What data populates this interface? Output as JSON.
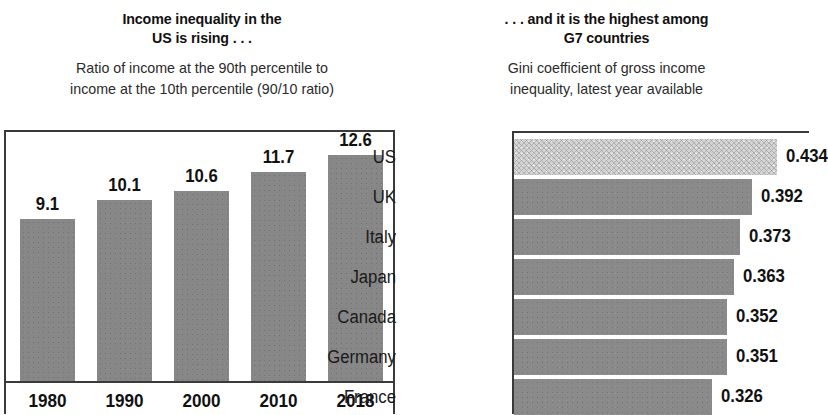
{
  "left_panel": {
    "title": "Income inequality in the\nUS is rising . . .",
    "subtitle": "Ratio of income at the 90th percentile to\nincome at the 10th percentile (90/10 ratio)"
  },
  "right_panel": {
    "title": ". . . and it is the highest among\nG7 countries",
    "subtitle": "Gini coefficient of gross income\ninequality, latest year available"
  },
  "colors": {
    "bar_gray": "#8a8a8a",
    "bar_highlight": "#d4d4d4",
    "frame": "#3a3a3a",
    "text": "#111111",
    "background": "#ffffff"
  },
  "chart_data": [
    {
      "type": "bar",
      "title": "Income inequality in the US is rising . . .",
      "subtitle": "Ratio of income at the 90th percentile to income at the 10th percentile (90/10 ratio)",
      "orientation": "vertical",
      "xlabel": "",
      "ylabel": "",
      "ylim": [
        0,
        14
      ],
      "grid": false,
      "legend": "none",
      "categories": [
        "1980",
        "1990",
        "2000",
        "2010",
        "2018"
      ],
      "values": [
        9.1,
        10.1,
        10.6,
        11.7,
        12.6
      ],
      "value_labels": [
        "9.1",
        "10.1",
        "10.6",
        "11.7",
        "12.6"
      ]
    },
    {
      "type": "bar",
      "title": ". . . and it is the highest among G7 countries",
      "subtitle": "Gini coefficient of gross income inequality, latest year available",
      "orientation": "horizontal",
      "xlabel": "",
      "ylabel": "",
      "xlim": [
        0,
        0.5
      ],
      "grid": false,
      "legend": "none",
      "categories": [
        "US",
        "UK",
        "Italy",
        "Japan",
        "Canada",
        "Germany",
        "France"
      ],
      "values": [
        0.434,
        0.392,
        0.373,
        0.363,
        0.352,
        0.351,
        0.326
      ],
      "value_labels": [
        "0.434",
        "0.392",
        "0.373",
        "0.363",
        "0.352",
        "0.351",
        "0.326"
      ],
      "highlighted_category": "US"
    }
  ]
}
